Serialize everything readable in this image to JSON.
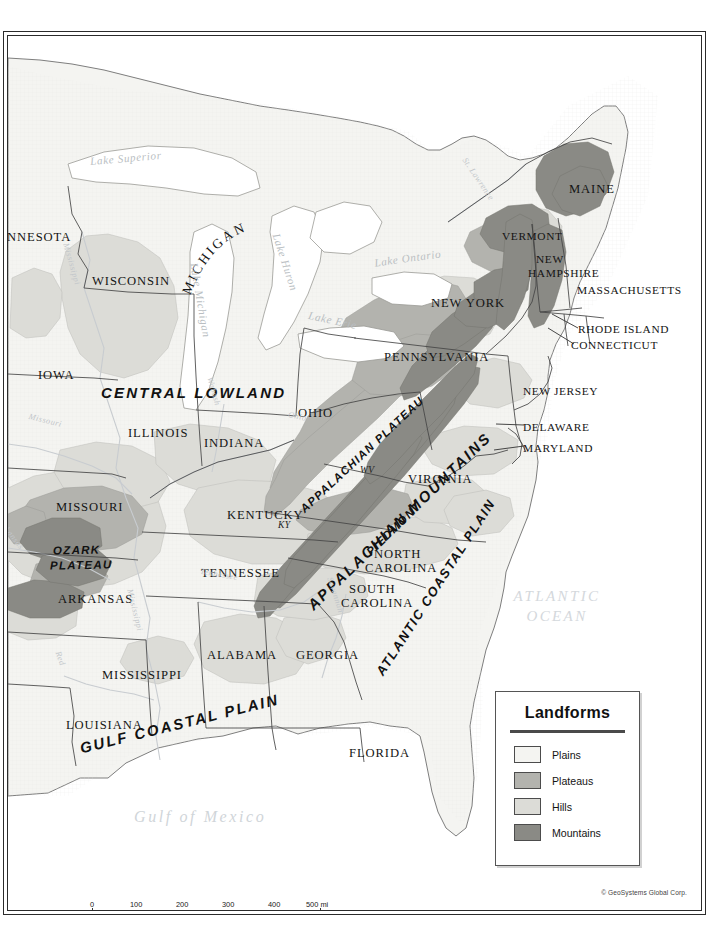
{
  "map": {
    "title": "Landforms of the Eastern United States",
    "copyright": "© GeoSystems Global Corp.",
    "background_color": "#ffffff",
    "land_color": "#f2f2ef",
    "border_color": "#2b2b2b"
  },
  "legend": {
    "title": "Landforms",
    "items": [
      {
        "label": "Plains",
        "color": "#f4f4f1"
      },
      {
        "label": "Plateaus",
        "color": "#b3b3ae"
      },
      {
        "label": "Hills",
        "color": "#dcdcd7"
      },
      {
        "label": "Mountains",
        "color": "#8a8a85"
      }
    ]
  },
  "scale": {
    "miles": {
      "unit": "mi",
      "ticks": [
        "0",
        "100",
        "200",
        "300",
        "400",
        "500"
      ]
    },
    "kilometers": {
      "unit": "km",
      "ticks": [
        "0",
        "100",
        "200",
        "300",
        "400",
        "500"
      ]
    },
    "miles_unit_label": "500 mi",
    "km_unit_label": "500 km"
  },
  "states": [
    {
      "name": "INNESOTA",
      "x": 2,
      "y": 200,
      "size": "state"
    },
    {
      "name": "WISCONSIN",
      "x": 88,
      "y": 243,
      "size": "state"
    },
    {
      "name": "IOWA",
      "x": 36,
      "y": 337,
      "size": "state"
    },
    {
      "name": "ILLINOIS",
      "x": 126,
      "y": 396,
      "size": "state"
    },
    {
      "name": "INDIANA",
      "x": 202,
      "y": 405,
      "size": "state"
    },
    {
      "name": "MISSOURI",
      "x": 55,
      "y": 470,
      "size": "state"
    },
    {
      "name": "ARKANSAS",
      "x": 56,
      "y": 561,
      "size": "state"
    },
    {
      "name": "LOUISIANA",
      "x": 64,
      "y": 687,
      "size": "state"
    },
    {
      "name": "MISSISSIPPI",
      "x": 100,
      "y": 637,
      "size": "state"
    },
    {
      "name": "ALABAMA",
      "x": 205,
      "y": 617,
      "size": "state"
    },
    {
      "name": "TENNESSEE",
      "x": 199,
      "y": 536,
      "size": "state"
    },
    {
      "name": "KENTUCKY",
      "x": 225,
      "y": 477,
      "size": "state"
    },
    {
      "name": "OHIO",
      "x": 296,
      "y": 376,
      "size": "state"
    },
    {
      "name": "GEORGIA",
      "x": 294,
      "y": 618,
      "size": "state"
    },
    {
      "name": "FLORIDA",
      "x": 347,
      "y": 716,
      "size": "state"
    },
    {
      "name": "SOUTH",
      "x": 346,
      "y": 552,
      "size": "state"
    },
    {
      "name": "CAROLINA",
      "x": 339,
      "y": 566,
      "size": "state"
    },
    {
      "name": "NORTH",
      "x": 372,
      "y": 517,
      "size": "state"
    },
    {
      "name": "CAROLINA",
      "x": 363,
      "y": 531,
      "size": "state"
    },
    {
      "name": "VIRGINIA",
      "x": 406,
      "y": 442,
      "size": "state"
    },
    {
      "name": "PENNSYLVANIA",
      "x": 382,
      "y": 320,
      "size": "state"
    },
    {
      "name": "NEW YORK",
      "x": 429,
      "y": 266,
      "size": "state"
    },
    {
      "name": "VERMONT",
      "x": 500,
      "y": 199,
      "size": "state sm"
    },
    {
      "name": "NEW",
      "x": 534,
      "y": 222,
      "size": "state sm"
    },
    {
      "name": "HAMPSHIRE",
      "x": 526,
      "y": 236,
      "size": "state sm"
    },
    {
      "name": "MAINE",
      "x": 567,
      "y": 152,
      "size": "state"
    },
    {
      "name": "MASSACHUSETTS",
      "x": 575,
      "y": 254,
      "size": "state sm"
    },
    {
      "name": "RHODE ISLAND",
      "x": 576,
      "y": 293,
      "size": "state sm"
    },
    {
      "name": "CONNECTICUT",
      "x": 569,
      "y": 309,
      "size": "state sm"
    },
    {
      "name": "NEW JERSEY",
      "x": 521,
      "y": 355,
      "size": "state sm"
    },
    {
      "name": "DELAWARE",
      "x": 521,
      "y": 391,
      "size": "state sm"
    },
    {
      "name": "MARYLAND",
      "x": 521,
      "y": 412,
      "size": "state sm"
    }
  ],
  "state_abbrevs": [
    {
      "name": "WV",
      "x": 358,
      "y": 434
    },
    {
      "name": "KY",
      "x": 276,
      "y": 489
    }
  ],
  "curved_labels": [
    {
      "name": "MICHIGAN",
      "type": "state-curved"
    }
  ],
  "regions": [
    {
      "name": "CENTRAL LOWLAND",
      "style": "region"
    },
    {
      "name": "OZARK PLATEAU",
      "style": "region sm"
    },
    {
      "name": "APPALACHIAN PLATEAU",
      "style": "region sm"
    },
    {
      "name": "APPALACHIAN MOUNTAINS",
      "style": "region"
    },
    {
      "name": "PIEDMONT",
      "style": "region sm"
    },
    {
      "name": "ATLANTIC COASTAL PLAIN",
      "style": "region md"
    },
    {
      "name": "GULF COASTAL PLAIN",
      "style": "region"
    }
  ],
  "region_parts": {
    "ozark_line1": "OZARK",
    "ozark_line2": "PLATEAU",
    "central_lowland": "CENTRAL LOWLAND",
    "appalachian_plateau": "APPALACHIAN PLATEAU",
    "appalachian_mountains": "APPALACHIAN MOUNTAINS",
    "piedmont": "PIEDMONT",
    "atlantic_coastal_plain": "ATLANTIC COASTAL PLAIN",
    "gulf_coastal_plain": "GULF COASTAL PLAIN"
  },
  "water": {
    "oceans": [
      {
        "line1": "ATLANTIC",
        "line2": "OCEAN",
        "x": 522,
        "y": 556
      }
    ],
    "gulf": {
      "name": "Gulf of Mexico",
      "x": 132,
      "y": 800
    },
    "lakes": [
      {
        "name": "Lake Superior",
        "x": 146,
        "y": 152
      },
      {
        "name": "Lake Michigan",
        "x": 203,
        "y": 237
      },
      {
        "name": "Lake Huron",
        "x": 285,
        "y": 213
      },
      {
        "name": "Lake Erie",
        "x": 321,
        "y": 310
      },
      {
        "name": "Lake Ontario",
        "x": 378,
        "y": 255
      }
    ],
    "rivers": [
      {
        "name": "Mississippi",
        "x": 72,
        "y": 239
      },
      {
        "name": "Mississippi",
        "x": 138,
        "y": 590
      },
      {
        "name": "Missouri",
        "x": 30,
        "y": 417
      },
      {
        "name": "Arkansas",
        "x": 2,
        "y": 520
      },
      {
        "name": "Red",
        "x": 61,
        "y": 649
      },
      {
        "name": "Ohio",
        "x": 289,
        "y": 418
      },
      {
        "name": "Wabash",
        "x": 213,
        "y": 381
      },
      {
        "name": "Tennessee",
        "x": 200,
        "y": 574
      },
      {
        "name": "Savannah",
        "x": 333,
        "y": 580
      },
      {
        "name": "St. Lawrence",
        "x": 470,
        "y": 158
      }
    ]
  },
  "landform_colors": {
    "plains": "#f4f4f1",
    "plateaus": "#b3b3ae",
    "hills": "#dcdcd7",
    "mountains": "#8a8a85",
    "water": "#ffffff",
    "outline": "#555555"
  }
}
